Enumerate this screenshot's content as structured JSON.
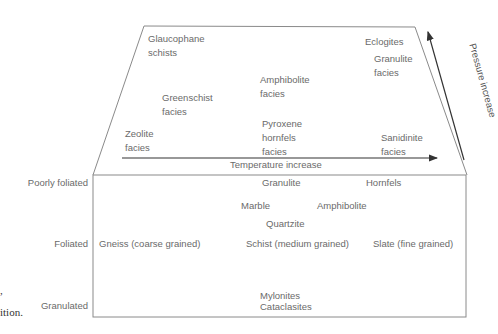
{
  "diagram": {
    "facies": {
      "glaucophane": [
        "Glaucophane",
        "schists"
      ],
      "eclogites": "Eclogites",
      "granulite": [
        "Granulite",
        "facies"
      ],
      "amphibolite": [
        "Amphibolite",
        "facies"
      ],
      "greenschist": [
        "Greenschist",
        "facies"
      ],
      "pyroxene": [
        "Pyroxene",
        "hornfels",
        "facies"
      ],
      "zeolite": [
        "Zeolite",
        "facies"
      ],
      "sanidinite": [
        "Sanidinite",
        "facies"
      ]
    },
    "axes": {
      "temperature": "Temperature increase",
      "pressure": "Pressure increase"
    },
    "texture_rows": {
      "poorly_foliated": "Poorly foliated",
      "foliated": "Foliated",
      "granulated": "Granulated"
    },
    "rocks": {
      "granulite": "Granulite",
      "hornfels": "Hornfels",
      "marble": "Marble",
      "amphibolite": "Amphibolite",
      "quartzite": "Quartzite",
      "gneiss": "Gneiss (coarse grained)",
      "schist": "Schist (medium grained)",
      "slate": "Slate (fine grained)",
      "mylonites": "Mylonites",
      "cataclasites": "Cataclasites"
    },
    "caption_fragment": {
      "line1": ",",
      "line2": "ition."
    },
    "colors": {
      "line": "#8a8a8a",
      "arrow": "#333333",
      "text": "#6a6a6a"
    }
  }
}
